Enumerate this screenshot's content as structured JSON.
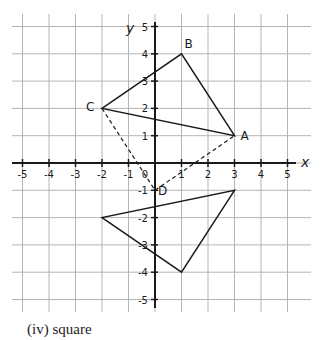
{
  "figure": {
    "axes": {
      "x_label": "x",
      "y_label": "y",
      "origin_label": "0",
      "x_range": [
        -5,
        5
      ],
      "y_range": [
        -5,
        5
      ],
      "x_ticks": [
        "-5",
        "-4",
        "-3",
        "-2",
        "-1",
        "1",
        "2",
        "3",
        "4",
        "5"
      ],
      "y_ticks": [
        "5",
        "4",
        "3",
        "2",
        "1",
        "-1",
        "-2",
        "-3",
        "-4",
        "-5"
      ]
    },
    "points": [
      {
        "label": "A",
        "x": 3,
        "y": 1
      },
      {
        "label": "B",
        "x": 1,
        "y": 4
      },
      {
        "label": "C",
        "x": -2,
        "y": 2
      },
      {
        "label": "D",
        "x": 0,
        "y": -1
      }
    ],
    "triangle_upper": [
      [
        3,
        1
      ],
      [
        1,
        4
      ],
      [
        -2,
        2
      ]
    ],
    "triangle_lower": [
      [
        3,
        -1
      ],
      [
        1,
        -4
      ],
      [
        -2,
        -2
      ]
    ],
    "dashed_segments": [
      [
        [
          -2,
          2
        ],
        [
          0,
          -1
        ]
      ],
      [
        [
          0,
          -1
        ],
        [
          3,
          1
        ]
      ]
    ],
    "colors": {
      "ink": "#1a1a1a",
      "grid": "#b5b5b5"
    }
  },
  "caption": "(iv) square"
}
